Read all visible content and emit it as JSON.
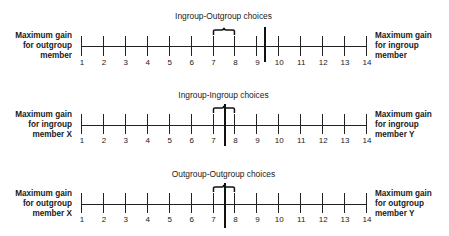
{
  "diagram": {
    "type": "scale-choice-matrices",
    "scale": {
      "min": 1,
      "max": 14,
      "ticks": [
        1,
        2,
        3,
        4,
        5,
        6,
        7,
        8,
        9,
        10,
        11,
        12,
        13,
        14
      ]
    },
    "panels": [
      {
        "title": "Ingroup-Outgroup choices",
        "left_label": [
          "Maximum gain",
          "for outgroup",
          "member"
        ],
        "right_label": [
          "Maximum gain",
          "for ingroup",
          "member"
        ],
        "brace_range": [
          7,
          8
        ],
        "marker_position": 9.35
      },
      {
        "title": "Ingroup-Ingroup choices",
        "left_label": [
          "Maximum gain",
          "for ingroup",
          "member X"
        ],
        "right_label": [
          "Maximum gain",
          "for ingroup",
          "member Y"
        ],
        "brace_range": [
          7,
          8
        ],
        "marker_position": 7.5
      },
      {
        "title": "Outgroup-Outgroup choices",
        "left_label": [
          "Maximum gain",
          "for outgroup",
          "member X"
        ],
        "right_label": [
          "Maximum gain",
          "for outgroup",
          "member Y"
        ],
        "brace_range": [
          7,
          8
        ],
        "marker_position": 7.5
      }
    ]
  }
}
